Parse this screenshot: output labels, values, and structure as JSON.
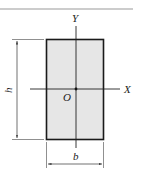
{
  "figure": {
    "type": "rectangular-cross-section",
    "labels": {
      "y_axis": "Y",
      "x_axis": "X",
      "origin": "O",
      "height": "h",
      "width": "b"
    },
    "colors": {
      "fill": "#e6e6e6",
      "stroke": "#1a1a1a",
      "rule": "#999999"
    }
  }
}
